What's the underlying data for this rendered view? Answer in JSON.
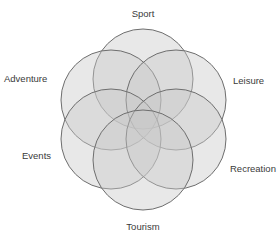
{
  "diagram": {
    "type": "overlapping-circles",
    "fill_color": "#c8c8c8",
    "stroke_color": "#6e6e6e",
    "label_color": "#3a3a3a",
    "circles": [
      {
        "label": "Sport",
        "cx": 143,
        "cy": 79,
        "r": 50,
        "label_x": 143,
        "label_y": 17,
        "anchor": "middle"
      },
      {
        "label": "Adventure",
        "cx": 111,
        "cy": 100,
        "r": 50,
        "label_x": 4,
        "label_y": 82,
        "anchor": "start"
      },
      {
        "label": "Leisure",
        "cx": 176,
        "cy": 100,
        "r": 50,
        "label_x": 233,
        "label_y": 84,
        "anchor": "start"
      },
      {
        "label": "Events",
        "cx": 111,
        "cy": 139,
        "r": 50,
        "label_x": 22,
        "label_y": 159,
        "anchor": "start"
      },
      {
        "label": "Recreation",
        "cx": 176,
        "cy": 139,
        "r": 50,
        "label_x": 230,
        "label_y": 172,
        "anchor": "start"
      },
      {
        "label": "Tourism",
        "cx": 143,
        "cy": 160,
        "r": 50,
        "label_x": 143,
        "label_y": 230,
        "anchor": "middle"
      }
    ]
  }
}
